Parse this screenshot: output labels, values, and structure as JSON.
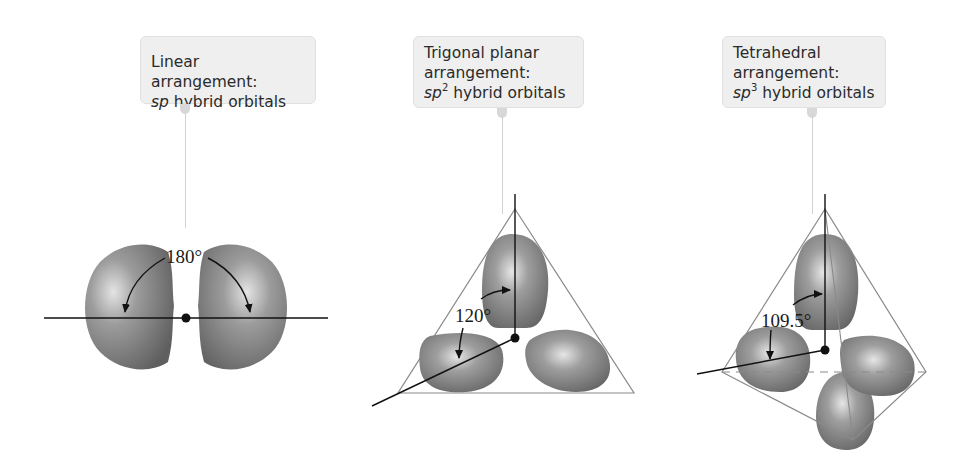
{
  "figure": {
    "panels": [
      {
        "id": "linear",
        "callout": {
          "line1": "Linear arrangement:",
          "line2_italic": "sp",
          "line2_sup": "",
          "line2_rest": " hybrid orbitals"
        },
        "angle_label": "180°",
        "orbital_count": 2
      },
      {
        "id": "trigonal-planar",
        "callout": {
          "line1": "Trigonal planar",
          "line1b": "arrangement:",
          "line2_italic": "sp",
          "line2_sup": "2",
          "line2_rest": " hybrid orbitals"
        },
        "angle_label": "120°",
        "orbital_count": 3
      },
      {
        "id": "tetrahedral",
        "callout": {
          "line1": "Tetrahedral",
          "line1b": "arrangement:",
          "line2_italic": "sp",
          "line2_sup": "3",
          "line2_rest": " hybrid orbitals"
        },
        "angle_label": "109.5°",
        "orbital_count": 4
      }
    ],
    "colors": {
      "orbital_fill": "#7a7a7a",
      "orbital_highlight": "#d8d8d8",
      "callout_bg": "#efefef",
      "outline": "#8a8a8a",
      "axis": "#111111"
    }
  }
}
